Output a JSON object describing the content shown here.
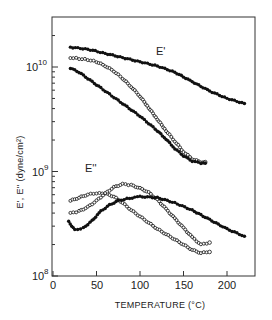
{
  "chart_data": {
    "type": "scatter",
    "title": "",
    "xlabel": "TEMPERATURE (°C)",
    "ylabel": "E', E'' (dyne/cm²)",
    "xlim": [
      0,
      230
    ],
    "ylim_log10": [
      8,
      10.45
    ],
    "yscale": "log",
    "grid": false,
    "legend": "none (inline labels)",
    "x_ticks": [
      0,
      50,
      100,
      150,
      200
    ],
    "y_ticks": [
      {
        "value": 100000000.0,
        "label_base": "10",
        "label_exp": "8"
      },
      {
        "value": 1000000000.0,
        "label_base": "10",
        "label_exp": "9"
      },
      {
        "value": 10000000000.0,
        "label_base": "10",
        "label_exp": "10"
      }
    ],
    "annotations": [
      {
        "text": "E'",
        "x": 145,
        "log10_y": 10.05
      },
      {
        "text": "E''",
        "x": 37,
        "log10_y": 8.95
      }
    ],
    "series": [
      {
        "name": "E' (filled, upper)",
        "group": "E'",
        "marker": "filled",
        "x": [
          20,
          40,
          60,
          80,
          100,
          120,
          140,
          160,
          180,
          200,
          220
        ],
        "log10_y": [
          10.19,
          10.17,
          10.13,
          10.09,
          10.05,
          10.01,
          9.95,
          9.86,
          9.77,
          9.7,
          9.65
        ]
      },
      {
        "name": "E' (open)",
        "group": "E'",
        "marker": "open",
        "x": [
          20,
          30,
          40,
          50,
          60,
          70,
          80,
          90,
          100,
          110,
          120,
          130,
          140,
          150,
          160,
          170,
          175
        ],
        "log10_y": [
          10.09,
          10.08,
          10.07,
          10.05,
          10.01,
          9.96,
          9.89,
          9.81,
          9.72,
          9.61,
          9.5,
          9.39,
          9.29,
          9.19,
          9.12,
          9.09,
          9.09
        ]
      },
      {
        "name": "E' (filled, lower)",
        "group": "E'",
        "marker": "filled",
        "x": [
          20,
          30,
          40,
          50,
          60,
          70,
          80,
          90,
          100,
          110,
          120,
          130,
          140,
          150,
          160,
          170,
          175
        ],
        "log10_y": [
          9.99,
          9.95,
          9.89,
          9.83,
          9.77,
          9.71,
          9.65,
          9.59,
          9.53,
          9.46,
          9.39,
          9.31,
          9.22,
          9.15,
          9.1,
          9.08,
          9.08
        ]
      },
      {
        "name": "E'' (open, peak ~50 °C)",
        "group": "E''",
        "marker": "open",
        "x": [
          20,
          30,
          40,
          50,
          60,
          70,
          80,
          90,
          100,
          110,
          120,
          130,
          140,
          150,
          160,
          170,
          180
        ],
        "log10_y": [
          8.72,
          8.75,
          8.78,
          8.79,
          8.79,
          8.76,
          8.7,
          8.63,
          8.57,
          8.51,
          8.45,
          8.4,
          8.35,
          8.3,
          8.25,
          8.22,
          8.23
        ]
      },
      {
        "name": "E'' (open, peak ~85 °C)",
        "group": "E''",
        "marker": "open",
        "x": [
          20,
          30,
          40,
          50,
          60,
          70,
          80,
          90,
          100,
          110,
          120,
          130,
          140,
          150,
          160,
          170,
          180
        ],
        "log10_y": [
          8.6,
          8.62,
          8.66,
          8.72,
          8.79,
          8.85,
          8.88,
          8.87,
          8.84,
          8.8,
          8.73,
          8.64,
          8.55,
          8.46,
          8.37,
          8.3,
          8.32
        ]
      },
      {
        "name": "E'' (filled)",
        "group": "E''",
        "marker": "filled",
        "x": [
          18,
          25,
          35,
          45,
          55,
          65,
          75,
          85,
          100,
          120,
          140,
          160,
          180,
          200,
          220
        ],
        "log10_y": [
          8.52,
          8.44,
          8.46,
          8.53,
          8.62,
          8.68,
          8.72,
          8.74,
          8.76,
          8.75,
          8.7,
          8.63,
          8.54,
          8.45,
          8.38
        ]
      }
    ]
  },
  "labels": {
    "x_axis_title": "TEMPERATURE (°C)",
    "y_axis_title": "E', E'' (dyne/cm²)",
    "series_e_prime": "E'",
    "series_e_double_prime": "E''",
    "y_tick_base": "10",
    "y_tick_10_exp": "10",
    "y_tick_9_exp": "9",
    "y_tick_8_exp": "8",
    "x_tick_0": "0",
    "x_tick_50": "50",
    "x_tick_100": "100",
    "x_tick_150": "150",
    "x_tick_200": "200"
  }
}
